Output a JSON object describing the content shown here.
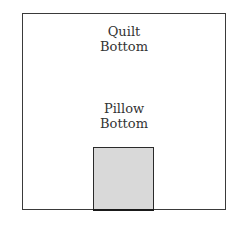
{
  "diagram": {
    "quilt_label_line1": "Quilt",
    "quilt_label_line2": "Bottom",
    "pillow_label_line1": "Pillow",
    "pillow_label_line2": "Bottom",
    "colors": {
      "outline": "#3a3a3a",
      "pillow_fill": "#d9d9d9",
      "background": "#ffffff"
    }
  }
}
